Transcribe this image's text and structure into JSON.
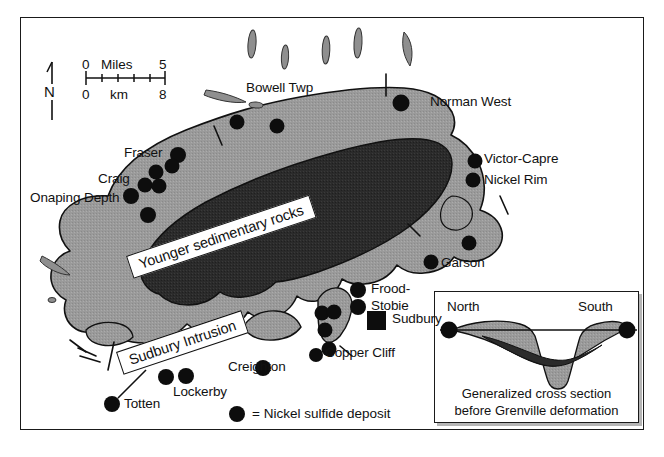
{
  "figure": {
    "type": "geologic-map"
  },
  "scalebar": {
    "top_left": "0",
    "top_unit": "Miles",
    "top_right": "5",
    "bottom_left": "0",
    "bottom_unit": "km",
    "bottom_right": "8"
  },
  "compass": {
    "label": "N"
  },
  "units": [
    {
      "id": "sediments",
      "label": "Younger sedimentary rocks",
      "color": "#2b2b2b"
    },
    {
      "id": "intrusion",
      "label": "Sudbury Intrusion",
      "color": "#9a9a9a"
    }
  ],
  "legend": {
    "symbol": "filled-circle",
    "text": "= Nickel sulfide deposit"
  },
  "city": {
    "label": "Sudbury",
    "symbol": "filled-square"
  },
  "deposits": [
    {
      "label": "Bowell Twp"
    },
    {
      "label": "Norman West"
    },
    {
      "label": "Fraser"
    },
    {
      "label": "Craig"
    },
    {
      "label": "Onaping Depth"
    },
    {
      "label": "Victor-Capre"
    },
    {
      "label": "Nickel Rim"
    },
    {
      "label": "Garson"
    },
    {
      "label": "Frood-"
    },
    {
      "label": "Stobie"
    },
    {
      "label": "Copper Cliff"
    },
    {
      "label": "Creighton"
    },
    {
      "label": "Lockerby"
    },
    {
      "label": "Totten"
    }
  ],
  "inset": {
    "left_label": "North",
    "right_label": "South",
    "caption_line1": "Generalized cross section",
    "caption_line2": "before Grenville deformation"
  },
  "colors": {
    "dark_unit": "#2b2b2b",
    "gray_unit": "#9a9a9a",
    "outline": "#111111",
    "background": "#ffffff"
  }
}
